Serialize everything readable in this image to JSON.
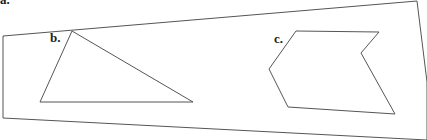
{
  "colors": {
    "background": "#ffffff",
    "stroke": "#555555",
    "label": "#222222"
  },
  "labels": {
    "a": "a.",
    "b": "b.",
    "c": "c."
  },
  "shapes": {
    "frame": {
      "name": "a",
      "points": "3,36 417,1 427,82 427,140 3,118"
    },
    "triangle": {
      "name": "b",
      "points": "72,31 193,102 40,102"
    },
    "hexagon": {
      "name": "c",
      "points": "296,31 379,32 361,53 395,114 288,107 269,69"
    }
  }
}
